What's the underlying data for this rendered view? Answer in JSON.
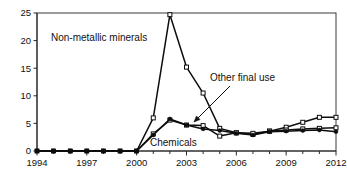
{
  "chart_data": {
    "type": "line",
    "title": "",
    "xlabel": "",
    "ylabel": "",
    "xlim": [
      1994,
      2012
    ],
    "ylim": [
      0,
      25
    ],
    "grid": false,
    "legend_position": "inline-annotations",
    "x": [
      1994,
      1995,
      1996,
      1997,
      1998,
      1999,
      2000,
      2001,
      2002,
      2003,
      2004,
      2005,
      2006,
      2007,
      2008,
      2009,
      2010,
      2011,
      2012
    ],
    "xtick_labels": [
      "1994",
      "1997",
      "2000",
      "2003",
      "2006",
      "2009",
      "2012"
    ],
    "xtick_values": [
      1994,
      1997,
      2000,
      2003,
      2006,
      2009,
      2012
    ],
    "ytick_labels": [
      "0",
      "5",
      "10",
      "15",
      "20",
      "25"
    ],
    "ytick_values": [
      0,
      5,
      10,
      15,
      20,
      25
    ],
    "series": [
      {
        "name": "Non-metallic minerals",
        "marker": "square",
        "values": [
          0,
          0,
          0,
          0,
          0,
          0,
          0,
          6.0,
          24.7,
          15.2,
          10.5,
          4.1,
          3.3,
          3.0,
          3.6,
          4.3,
          5.2,
          6.1,
          6.1
        ]
      },
      {
        "name": "Other final use",
        "marker": "square",
        "values": [
          0,
          0,
          0,
          0,
          0,
          0,
          0,
          3.1,
          5.6,
          4.7,
          4.6,
          2.7,
          3.3,
          3.2,
          3.6,
          3.8,
          4.0,
          4.1,
          4.2
        ]
      },
      {
        "name": "Chemicals",
        "marker": "dot",
        "values": [
          0,
          0,
          0,
          0,
          0,
          0,
          0,
          2.9,
          5.8,
          4.7,
          4.0,
          3.7,
          3.2,
          2.9,
          3.5,
          3.6,
          3.7,
          3.8,
          3.5
        ]
      }
    ],
    "annotations": [
      {
        "id": "non-metallic-minerals",
        "text": "Non-metallic minerals",
        "x": 51,
        "y": 41,
        "leader": false
      },
      {
        "id": "other-final-use",
        "text": "Other final use",
        "x": 210,
        "y": 81,
        "leader": true,
        "leader_from": [
          230,
          86
        ],
        "leader_to": [
          194,
          122
        ]
      },
      {
        "id": "chemicals",
        "text": "Chemicals",
        "x": 150,
        "y": 146,
        "leader": false
      }
    ]
  },
  "axes": {
    "y_axis_name": "value-axis",
    "x_axis_name": "year-axis"
  },
  "colors": {
    "line": "#0d0d0d",
    "axis": "#2b2b2b",
    "frame": "#3a3a3a",
    "background": "#ffffff",
    "text": "#111111"
  }
}
